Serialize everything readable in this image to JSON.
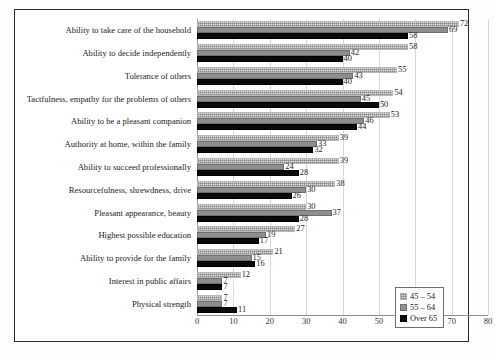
{
  "chart_data": {
    "type": "bar",
    "orientation": "horizontal",
    "title": "",
    "subtitle": "",
    "xlabel": "",
    "ylabel": "",
    "xlim": [
      0,
      80
    ],
    "xticks": [
      0,
      10,
      20,
      30,
      40,
      50,
      60,
      70,
      80
    ],
    "grid": true,
    "legend_position": "bottom-right",
    "categories": [
      "Ability to take care of the household",
      "Ability to decide independently",
      "Tolerance of others",
      "Tactfulness, empathy for the problems of others",
      "Ability to be a pleasant companion",
      "Authority at home, within the family",
      "Ability to succeed professionally",
      "Resourcefulness, shrewdness, drive",
      "Pleasant appearance, beauty",
      "Highest possible education",
      "Ability to provide for the family",
      "Interest in public affairs",
      "Physical strength"
    ],
    "series": [
      {
        "name": "45 – 54",
        "color": "#e2e2e2",
        "pattern": "stipple",
        "values": [
          72,
          58,
          55,
          54,
          53,
          39,
          39,
          38,
          30,
          27,
          21,
          12,
          7
        ]
      },
      {
        "name": "55 – 64",
        "color": "#8e8e8e",
        "pattern": "solid",
        "values": [
          69,
          42,
          43,
          45,
          46,
          33,
          24,
          30,
          37,
          19,
          15,
          7,
          7
        ]
      },
      {
        "name": "Over 65",
        "color": "#0a0a0a",
        "pattern": "solid",
        "values": [
          58,
          40,
          40,
          50,
          44,
          32,
          28,
          26,
          28,
          17,
          16,
          7,
          11
        ]
      }
    ]
  },
  "colors": {
    "frame": "#2b2b2b",
    "grid": "#d9d9d9",
    "axis": "#8d8d8d",
    "background": "#ffffff"
  }
}
